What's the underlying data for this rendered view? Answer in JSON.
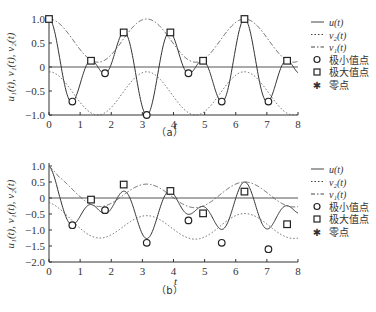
{
  "chart_data": [
    {
      "type": "line",
      "panel": "a",
      "caption": "（a）",
      "xlabel": "t",
      "ylabel": "u₁(t), v₁(t), v₂(t)",
      "xlim": [
        0,
        8
      ],
      "ylim": [
        -1.0,
        1.0
      ],
      "xticks": [
        "0",
        "1",
        "2",
        "3",
        "4",
        "5",
        "6",
        "7",
        "8"
      ],
      "yticks": [
        "1.0",
        "0.5",
        "0",
        "−0.5",
        "−1.0"
      ],
      "ytick_values": [
        1.0,
        0.5,
        0,
        -0.5,
        -1.0
      ],
      "zero_line": true,
      "series": [
        {
          "name": "u(t)",
          "style": "solid",
          "formula_desc": "cos(t)·cos(4t)"
        },
        {
          "name": "v₂(t)",
          "style": "dotted",
          "formula_desc": "lower envelope"
        },
        {
          "name": "v₁(t)",
          "style": "dashdot",
          "formula_desc": "upper envelope"
        }
      ],
      "minima": [
        [
          0.75,
          -0.72
        ],
        [
          1.8,
          -0.13
        ],
        [
          3.14,
          -1.0
        ],
        [
          4.48,
          -0.13
        ],
        [
          5.55,
          -0.72
        ],
        [
          7.05,
          -0.72
        ]
      ],
      "maxima": [
        [
          0,
          1.0
        ],
        [
          1.35,
          0.13
        ],
        [
          2.4,
          0.72
        ],
        [
          3.9,
          0.72
        ],
        [
          4.95,
          0.13
        ],
        [
          6.28,
          1.0
        ],
        [
          7.65,
          0.13
        ]
      ]
    },
    {
      "type": "line",
      "panel": "b",
      "caption": "（b）",
      "xlabel": "t",
      "ylabel": "u₁(t), v₁(t), v₂(t)",
      "xlim": [
        0,
        8
      ],
      "ylim": [
        -2.0,
        1.0
      ],
      "xticks": [
        "0",
        "1",
        "2",
        "3",
        "4",
        "5",
        "6",
        "7",
        "8"
      ],
      "yticks": [
        "1.0",
        "0.5",
        "0",
        "−0.5",
        "−1.0",
        "−1.5",
        "−2.0"
      ],
      "ytick_values": [
        1.0,
        0.5,
        0,
        -0.5,
        -1.0,
        -1.5,
        -2.0
      ],
      "zero_line": true,
      "series": [
        {
          "name": "u(t)",
          "style": "solid"
        },
        {
          "name": "v₂(t)",
          "style": "dotted"
        },
        {
          "name": "v₁(t)",
          "style": "dashdot"
        }
      ],
      "minima": [
        [
          0.75,
          -0.85
        ],
        [
          1.8,
          -0.38
        ],
        [
          3.14,
          -1.4
        ],
        [
          4.48,
          -0.7
        ],
        [
          5.55,
          -1.4
        ],
        [
          7.05,
          -1.6
        ]
      ],
      "maxima": [
        [
          1.35,
          -0.05
        ],
        [
          2.4,
          0.42
        ],
        [
          3.9,
          0.22
        ],
        [
          4.95,
          -0.48
        ],
        [
          6.28,
          0.2
        ],
        [
          7.65,
          -0.82
        ]
      ]
    }
  ],
  "legend": {
    "items": [
      {
        "label": "u(t)",
        "symbol": "solid-line"
      },
      {
        "label": "v₂(t)",
        "symbol": "dotted-line"
      },
      {
        "label": "v₁(t)",
        "symbol": "dashdot-line"
      },
      {
        "label": "极小值点",
        "symbol": "circle"
      },
      {
        "label": "极大值点",
        "symbol": "square"
      },
      {
        "label": "零点",
        "symbol": "star"
      }
    ]
  }
}
